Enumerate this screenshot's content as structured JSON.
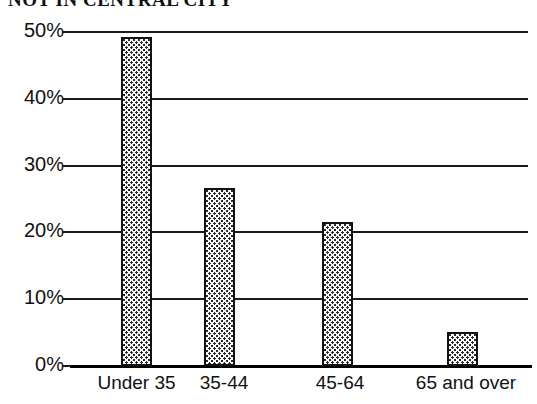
{
  "chart_data": {
    "type": "bar",
    "title": "NOT IN CENTRAL CITY",
    "xlabel": "",
    "ylabel": "",
    "categories": [
      "Under 35",
      "35-44",
      "45-64",
      "65 and over"
    ],
    "values": [
      49.3,
      26.6,
      21.5,
      5.1
    ],
    "value_labels": [
      "",
      "",
      "",
      ""
    ],
    "ylim": [
      0,
      50
    ],
    "yticks": [
      0,
      10,
      20,
      30,
      40,
      50
    ],
    "ytick_labels": [
      "0%",
      "10%",
      "20%",
      "30%",
      "40%",
      "50%"
    ],
    "grid": true,
    "grid_axis": "y",
    "legend": false,
    "legend_position": "none",
    "bar_color": "#ffffff",
    "bar_edge_color": "#111111",
    "bar_fill_pattern": "fine-dotted-checker",
    "axis_color": "#1a1a1a",
    "background_color": "#ffffff"
  },
  "chart": {
    "title": "NOT IN CENTRAL CITY",
    "title_clipped": true,
    "y_axis": {
      "ticks": [
        {
          "label": "50%",
          "value": 50
        },
        {
          "label": "40%",
          "value": 40
        },
        {
          "label": "30%",
          "value": 30
        },
        {
          "label": "20%",
          "value": 20
        },
        {
          "label": "10%",
          "value": 10
        },
        {
          "label": "0%",
          "value": 0
        }
      ]
    },
    "x_axis": {
      "labels": [
        "Under 35",
        "35-44",
        "45-64",
        "65 and over"
      ]
    },
    "bars": [
      {
        "category": "Under 35",
        "value": 49.3
      },
      {
        "category": "35-44",
        "value": 26.6
      },
      {
        "category": "45-64",
        "value": 21.5
      },
      {
        "category": "65 and over",
        "value": 5.1
      }
    ]
  }
}
